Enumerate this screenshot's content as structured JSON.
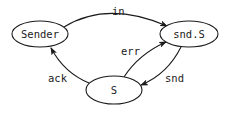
{
  "diagram": {
    "type": "state-machine",
    "nodes": [
      {
        "id": "sender",
        "label": "Sender",
        "cx": 40,
        "cy": 34,
        "rx": 28,
        "ry": 13
      },
      {
        "id": "snds",
        "label": "snd.S",
        "cx": 189,
        "cy": 34,
        "rx": 29,
        "ry": 13
      },
      {
        "id": "s",
        "label": "S",
        "cx": 114,
        "cy": 90,
        "rx": 28,
        "ry": 14
      }
    ],
    "edges": [
      {
        "id": "in",
        "from": "sender",
        "to": "snds",
        "label": "in"
      },
      {
        "id": "err",
        "from": "s",
        "to": "snds",
        "label": "err"
      },
      {
        "id": "snd",
        "from": "snds",
        "to": "s",
        "label": "snd"
      },
      {
        "id": "ack",
        "from": "s",
        "to": "sender",
        "label": "ack"
      }
    ]
  },
  "colors": {
    "stroke": "#1a1a1a",
    "background": "#ffffff"
  }
}
